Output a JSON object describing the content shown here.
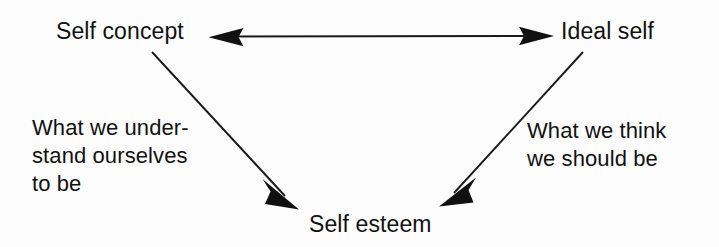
{
  "diagram": {
    "type": "concept-triangle",
    "background_color": "#fdfdfd",
    "ink_color": "#111111",
    "nodes": [
      {
        "id": "self-concept",
        "label": "Self concept",
        "position": "top-left"
      },
      {
        "id": "ideal-self",
        "label": "Ideal self",
        "position": "top-right"
      },
      {
        "id": "self-esteem",
        "label": "Self esteem",
        "position": "bottom-center"
      }
    ],
    "captions": [
      {
        "id": "left-caption",
        "text": "What we under-\nstand ourselves\nto be",
        "lines": [
          "What we under-",
          "stand ourselves",
          "to be"
        ],
        "describes": "self-concept"
      },
      {
        "id": "right-caption",
        "text": "What we think\nwe should be",
        "lines": [
          "What we think",
          "we should be"
        ],
        "describes": "ideal-self"
      }
    ],
    "connectors": [
      {
        "id": "self-concept-ideal-self",
        "from": "self-concept",
        "to": "ideal-self",
        "style": "double-headed-horizontal-arrow"
      },
      {
        "id": "self-concept-self-esteem",
        "from": "self-concept",
        "to": "self-esteem",
        "style": "single-headed-diagonal-arrow"
      },
      {
        "id": "ideal-self-self-esteem",
        "from": "ideal-self",
        "to": "self-esteem",
        "style": "single-headed-diagonal-arrow"
      }
    ]
  }
}
